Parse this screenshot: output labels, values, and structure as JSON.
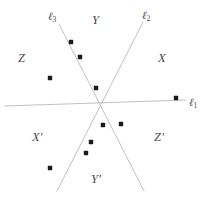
{
  "figure": {
    "background_color": "#ffffff",
    "width": 207,
    "height": 198,
    "line_color": "#b9b9b9",
    "point_color": "#1a1a1a",
    "label_color": "#4a4a4a"
  },
  "lines": [
    {
      "id": "l1",
      "label": "ℓ",
      "subscript": "1",
      "label_x": 189,
      "label_y": 97,
      "x1": 5,
      "y1": 106,
      "x2": 186,
      "y2": 100,
      "orientation": "horizontal"
    },
    {
      "id": "l2",
      "label": "ℓ",
      "subscript": "2",
      "label_x": 142,
      "label_y": 10,
      "x1": 143,
      "y1": 22,
      "x2": 57,
      "y2": 191,
      "orientation": "descending-left"
    },
    {
      "id": "l3",
      "label": "ℓ",
      "subscript": "3",
      "label_x": 48,
      "label_y": 11,
      "x1": 59,
      "y1": 24,
      "x2": 144,
      "y2": 191,
      "orientation": "descending-right"
    }
  ],
  "intersection": {
    "x": 97,
    "y": 104
  },
  "region_labels": [
    {
      "id": "Y",
      "text": "Y",
      "prime": "",
      "x": 92,
      "y": 14
    },
    {
      "id": "Z",
      "text": "Z",
      "prime": "",
      "x": 18,
      "y": 52
    },
    {
      "id": "X",
      "text": "X",
      "prime": "",
      "x": 158,
      "y": 52
    },
    {
      "id": "Xp",
      "text": "X",
      "prime": "′",
      "x": 32,
      "y": 131
    },
    {
      "id": "Zp",
      "text": "Z",
      "prime": "′",
      "x": 154,
      "y": 131
    },
    {
      "id": "Yp",
      "text": "Y",
      "prime": "′",
      "x": 91,
      "y": 173
    }
  ],
  "chart_data": {
    "type": "scatter",
    "xlabel": "",
    "ylabel": "",
    "xlim": [
      0,
      207
    ],
    "ylim": [
      0,
      198
    ],
    "grid": false,
    "legend": "none",
    "point_radius": 2.2,
    "points": [
      {
        "x": 71,
        "y": 42,
        "region": "Y"
      },
      {
        "x": 80,
        "y": 57,
        "region": "Y"
      },
      {
        "x": 50,
        "y": 78,
        "region": "Z"
      },
      {
        "x": 96,
        "y": 88,
        "region": "Y"
      },
      {
        "x": 176,
        "y": 98,
        "region": "X"
      },
      {
        "x": 121,
        "y": 124,
        "region": "Z'"
      },
      {
        "x": 103,
        "y": 125,
        "region": "Y'"
      },
      {
        "x": 91,
        "y": 142,
        "region": "Y'"
      },
      {
        "x": 86,
        "y": 153,
        "region": "Y'"
      },
      {
        "x": 50,
        "y": 168,
        "region": "X'"
      }
    ]
  }
}
